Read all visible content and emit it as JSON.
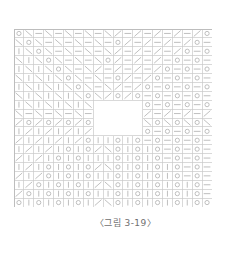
{
  "figure": {
    "caption": "〈그림 3-19〉",
    "grid": {
      "columns": 20,
      "rows": 20,
      "cell_width": 9.9,
      "cell_height": 8.9,
      "line_color": "#c9c9c9",
      "glyph_color": "#b8b8b8",
      "background": "#ffffff",
      "blank_region": {
        "col_start": 8,
        "col_end": 12,
        "row_start": 8,
        "row_end": 11,
        "label": "blank-region"
      },
      "glyph_legend": {
        "bslash": "\\",
        "fslash": "/",
        "vbar": "|",
        "dash": "—",
        "circle": "○",
        "blank": ""
      },
      "cells": [
        [
          "circle",
          "bslash",
          "dash",
          "bslash",
          "dash",
          "bslash",
          "dash",
          "bslash",
          "dash",
          "bslash",
          "fslash",
          "dash",
          "fslash",
          "dash",
          "fslash",
          "dash",
          "fslash",
          "dash",
          "fslash",
          "circle"
        ],
        [
          "bslash",
          "circle",
          "bslash",
          "dash",
          "bslash",
          "dash",
          "bslash",
          "dash",
          "bslash",
          "dash",
          "circle",
          "fslash",
          "dash",
          "fslash",
          "dash",
          "fslash",
          "dash",
          "fslash",
          "circle",
          "dash"
        ],
        [
          "vbar",
          "bslash",
          "circle",
          "bslash",
          "dash",
          "bslash",
          "dash",
          "bslash",
          "dash",
          "bslash",
          "fslash",
          "dash",
          "fslash",
          "dash",
          "fslash",
          "dash",
          "fslash",
          "circle",
          "dash",
          "circle"
        ],
        [
          "bslash",
          "vbar",
          "bslash",
          "circle",
          "bslash",
          "dash",
          "bslash",
          "dash",
          "bslash",
          "circle",
          "fslash",
          "dash",
          "fslash",
          "dash",
          "fslash",
          "dash",
          "circle",
          "dash",
          "circle",
          "dash"
        ],
        [
          "vbar",
          "bslash",
          "vbar",
          "bslash",
          "circle",
          "bslash",
          "dash",
          "bslash",
          "fslash",
          "dash",
          "fslash",
          "dash",
          "fslash",
          "dash",
          "fslash",
          "circle",
          "dash",
          "circle",
          "dash",
          "circle"
        ],
        [
          "bslash",
          "vbar",
          "bslash",
          "vbar",
          "bslash",
          "circle",
          "bslash",
          "dash",
          "bslash",
          "dash",
          "circle",
          "fslash",
          "dash",
          "fslash",
          "circle",
          "dash",
          "circle",
          "dash",
          "circle",
          "dash"
        ],
        [
          "vbar",
          "bslash",
          "vbar",
          "bslash",
          "vbar",
          "bslash",
          "circle",
          "bslash",
          "dash",
          "bslash",
          "fslash",
          "dash",
          "fslash",
          "circle",
          "dash",
          "circle",
          "dash",
          "circle",
          "dash",
          "circle"
        ],
        [
          "bslash",
          "vbar",
          "bslash",
          "vbar",
          "bslash",
          "vbar",
          "bslash",
          "circle",
          "bslash",
          "fslash",
          "circle",
          "fslash",
          "circle",
          "dash",
          "circle",
          "dash",
          "circle",
          "dash",
          "circle",
          "dash"
        ],
        [
          "vbar",
          "bslash",
          "vbar",
          "bslash",
          "vbar",
          "bslash",
          "vbar",
          "bslash",
          "blank",
          "blank",
          "blank",
          "blank",
          "dash",
          "circle",
          "dash",
          "circle",
          "dash",
          "circle",
          "dash",
          "circle"
        ],
        [
          "bslash",
          "dash",
          "bslash",
          "dash",
          "bslash",
          "dash",
          "bslash",
          "dash",
          "blank",
          "blank",
          "blank",
          "blank",
          "dash",
          "fslash",
          "dash",
          "fslash",
          "dash",
          "fslash",
          "dash",
          "fslash"
        ],
        [
          "fslash",
          "circle",
          "fslash",
          "circle",
          "fslash",
          "circle",
          "fslash",
          "circle",
          "blank",
          "blank",
          "blank",
          "blank",
          "circle",
          "bslash",
          "circle",
          "bslash",
          "circle",
          "bslash",
          "circle",
          "bslash"
        ],
        [
          "vbar",
          "fslash",
          "vbar",
          "fslash",
          "vbar",
          "fslash",
          "vbar",
          "fslash",
          "blank",
          "blank",
          "blank",
          "blank",
          "dash",
          "circle",
          "dash",
          "circle",
          "dash",
          "circle",
          "dash",
          "circle"
        ],
        [
          "fslash",
          "vbar",
          "fslash",
          "vbar",
          "fslash",
          "vbar",
          "fslash",
          "circle",
          "vbar",
          "vbar",
          "circle",
          "vbar",
          "circle",
          "dash",
          "circle",
          "dash",
          "circle",
          "dash",
          "circle",
          "dash"
        ],
        [
          "vbar",
          "fslash",
          "vbar",
          "fslash",
          "vbar",
          "circle",
          "vbar",
          "circle",
          "fslash",
          "bslash",
          "circle",
          "vbar",
          "circle",
          "vbar",
          "circle",
          "dash",
          "circle",
          "dash",
          "circle",
          "dash"
        ],
        [
          "fslash",
          "vbar",
          "fslash",
          "vbar",
          "circle",
          "vbar",
          "circle",
          "vbar",
          "vbar",
          "vbar",
          "circle",
          "vbar",
          "circle",
          "vbar",
          "circle",
          "dash",
          "circle",
          "dash",
          "circle",
          "dash"
        ],
        [
          "vbar",
          "fslash",
          "vbar",
          "circle",
          "vbar",
          "circle",
          "vbar",
          "circle",
          "fslash",
          "bslash",
          "circle",
          "vbar",
          "circle",
          "vbar",
          "circle",
          "vbar",
          "circle",
          "dash",
          "circle",
          "dash"
        ],
        [
          "fslash",
          "vbar",
          "fslash",
          "circle",
          "vbar",
          "circle",
          "vbar",
          "circle",
          "vbar",
          "vbar",
          "circle",
          "vbar",
          "circle",
          "vbar",
          "circle",
          "vbar",
          "circle",
          "dash",
          "circle",
          "dash"
        ],
        [
          "vbar",
          "fslash",
          "circle",
          "vbar",
          "circle",
          "vbar",
          "circle",
          "vbar",
          "fslash",
          "bslash",
          "circle",
          "vbar",
          "circle",
          "vbar",
          "circle",
          "vbar",
          "circle",
          "vbar",
          "circle",
          "dash"
        ],
        [
          "fslash",
          "circle",
          "vbar",
          "circle",
          "vbar",
          "circle",
          "vbar",
          "circle",
          "vbar",
          "vbar",
          "circle",
          "vbar",
          "circle",
          "vbar",
          "circle",
          "vbar",
          "circle",
          "vbar",
          "circle",
          "dash"
        ],
        [
          "circle",
          "vbar",
          "circle",
          "vbar",
          "circle",
          "vbar",
          "circle",
          "vbar",
          "fslash",
          "bslash",
          "circle",
          "vbar",
          "circle",
          "vbar",
          "circle",
          "vbar",
          "circle",
          "vbar",
          "circle",
          "circle"
        ]
      ]
    }
  }
}
